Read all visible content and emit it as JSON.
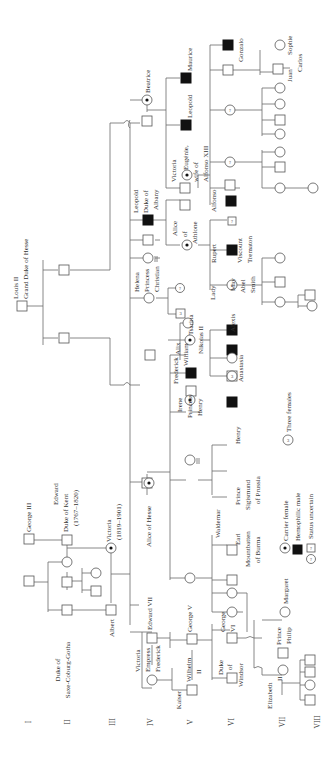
{
  "generations": [
    "I",
    "II",
    "III",
    "IV",
    "V",
    "VI",
    "VII",
    "VIII"
  ],
  "legend": {
    "carrier_female": "Carrier female",
    "hemophilic_male": "Hemophilic male",
    "status_uncertain": "Status uncertain",
    "three_females": "Three females",
    "three_females_symbol": "3",
    "uncertain_symbol": "?"
  },
  "people": {
    "george_iii": "George III",
    "edward_kent_1": "Edward",
    "edward_kent_2": "Duke of Kent",
    "edward_kent_3": "(1767–1820)",
    "saxe_1": "Duke of",
    "saxe_2": "Saxe-Coburg-Gotha",
    "victoria_1": "Victoria",
    "victoria_2": "(1819–1901)",
    "albert": "Albert",
    "louis_1": "Louis II",
    "louis_2": "Grand Duke of Hesse",
    "empress_1": "Victoria",
    "empress_2": "Empress",
    "empress_3": "Frederick",
    "edward_vii": "Edward VII",
    "alice_hesse": "Alice of Hesse",
    "helena_1": "Helena",
    "helena_2": "Princess",
    "helena_3": "Christian",
    "leopold_1": "Leopold",
    "leopold_2": "Duke of",
    "leopold_3": "Albany",
    "beatrice": "Beatrice",
    "kaiser_1": "Kaiser",
    "kaiser_2": "Wilhelm",
    "kaiser_3": "II",
    "george_v": "George V",
    "irene_1": "Irene",
    "irene_2": "Princess",
    "irene_3": "Henry",
    "frederick_1": "Frederick",
    "frederick_2": "William",
    "alix_1": "Alix",
    "alix_2": "Tsarina",
    "alix_3": "Nikolas II",
    "alice_athlone_1": "Alice",
    "alice_athlone_2": "of",
    "alice_athlone_3": "Athlone",
    "ve_1": "Victoria",
    "ve_2": "Eugénie,",
    "ve_3": "wife of",
    "ve_4": "Alfonso XIII",
    "leopold_b": "Leopold",
    "maurice": "Maurice",
    "windsor_1": "Duke",
    "windsor_2": "of",
    "windsor_3": "Windsor",
    "george_vi_1": "George",
    "george_vi_2": "VI",
    "mountbatten_1": "Earl",
    "mountbatten_2": "Mountbatten",
    "mountbatten_3": "of Burma",
    "waldemar": "Waldemar",
    "sigmund_1": "Prince",
    "sigmund_2": "Sigismund",
    "sigmund_3": "of Prussia",
    "henry": "Henry",
    "anastasia": "Anastasia",
    "alexis": "Alexis",
    "lady_may_1": "Lady",
    "lady_may_2": "May",
    "lady_may_3": "Abel",
    "lady_may_4": "Smith",
    "rupert_1": "Rupert",
    "rupert_2": "Viscount",
    "rupert_3": "Trematon",
    "alfonso": "Alfonso",
    "gonzalo": "Gonzalo",
    "elizabeth_1": "Elizabeth",
    "elizabeth_2": "II",
    "philip_1": "Prince",
    "philip_2": "Philip",
    "margaret": "Margaret",
    "juan_1": "Juan",
    "juan_2": "Carlos",
    "sophie": "Sophie"
  },
  "colors": {
    "background": "#ffffff",
    "line": "#6a6a6a",
    "affected": "#111111",
    "text": "#333333"
  }
}
